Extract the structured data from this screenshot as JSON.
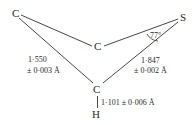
{
  "diagram": {
    "atoms": {
      "c_left": "C",
      "c_mid": "C",
      "s_right": "S",
      "c_bottom": "C",
      "h_bottom": "H"
    },
    "bond_labels": {
      "c_c_value": "1·550",
      "c_c_error": "± 0·003 Å",
      "c_s_value": "1·847",
      "c_s_error": "± 0·002 Å",
      "c_h": "1·101 ± 0·006 Å"
    },
    "angle_label": "77°"
  }
}
